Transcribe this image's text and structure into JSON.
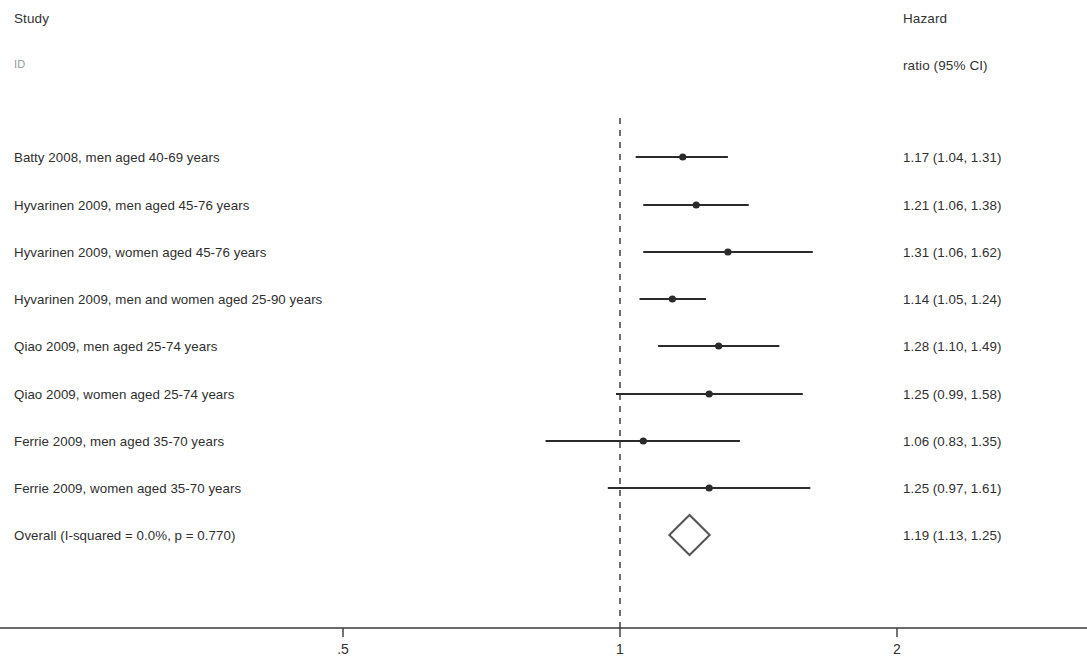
{
  "header": {
    "study_col": "Study",
    "id_col": "ID",
    "effect_col_line1": "Hazard",
    "effect_col_line2": "ratio (95% CI)"
  },
  "axis": {
    "tick_labels": [
      ".5",
      "1",
      "2"
    ],
    "tick_values": [
      0.5,
      1,
      2
    ],
    "null_line_value": 1,
    "scale": "log2",
    "x_of_1_px": 620,
    "px_per_doubling": 277
  },
  "colors": {
    "line": "#2b2b2b",
    "text": "#2f2f2f",
    "axis": "#3a3a3a",
    "null_line": "#4a4a4a",
    "diamond_stroke": "#555555"
  },
  "chart_data": {
    "type": "forest",
    "title": "",
    "xlabel": "",
    "ylabel": "",
    "xlim": [
      0.42,
      2.2
    ],
    "xscale": "log",
    "xticks": [
      0.5,
      1,
      2
    ],
    "xticklabels": [
      ".5",
      "1",
      "2"
    ],
    "grid": false,
    "legend": false,
    "null_line": 1,
    "effect_measure": "Hazard ratio (95% CI)",
    "rows": [
      {
        "label": "Batty 2008, men aged 40-69 years",
        "estimate": 1.17,
        "lower": 1.04,
        "upper": 1.31,
        "text": "1.17 (1.04, 1.31)",
        "y": 157,
        "type": "study"
      },
      {
        "label": "Hyvarinen 2009, men aged 45-76 years",
        "estimate": 1.21,
        "lower": 1.06,
        "upper": 1.38,
        "text": "1.21 (1.06, 1.38)",
        "y": 205,
        "type": "study"
      },
      {
        "label": "Hyvarinen 2009, women aged 45-76 years",
        "estimate": 1.31,
        "lower": 1.06,
        "upper": 1.62,
        "text": "1.31 (1.06, 1.62)",
        "y": 252,
        "type": "study"
      },
      {
        "label": "Hyvarinen 2009, men and women aged 25-90 years",
        "estimate": 1.14,
        "lower": 1.05,
        "upper": 1.24,
        "text": "1.14 (1.05, 1.24)",
        "y": 299,
        "type": "study"
      },
      {
        "label": "Qiao  2009,  men aged 25-74 years",
        "estimate": 1.28,
        "lower": 1.1,
        "upper": 1.49,
        "text": "1.28 (1.10, 1.49)",
        "y": 346,
        "type": "study"
      },
      {
        "label": "Qiao 2009,  women  aged 25-74 years",
        "estimate": 1.25,
        "lower": 0.99,
        "upper": 1.58,
        "text": "1.25 (0.99, 1.58)",
        "y": 394,
        "type": "study"
      },
      {
        "label": "Ferrie 2009, men aged 35-70 years",
        "estimate": 1.06,
        "lower": 0.83,
        "upper": 1.35,
        "text": "1.06 (0.83, 1.35)",
        "y": 441,
        "type": "study"
      },
      {
        "label": "Ferrie 2009, women aged 35-70 years",
        "estimate": 1.25,
        "lower": 0.97,
        "upper": 1.61,
        "text": "1.25 (0.97, 1.61)",
        "y": 488,
        "type": "study"
      },
      {
        "label": "Overall  (I-squared = 0.0%, p = 0.770)",
        "estimate": 1.19,
        "lower": 1.13,
        "upper": 1.25,
        "text": "1.19 (1.13, 1.25)",
        "y": 535,
        "type": "summary"
      }
    ]
  }
}
